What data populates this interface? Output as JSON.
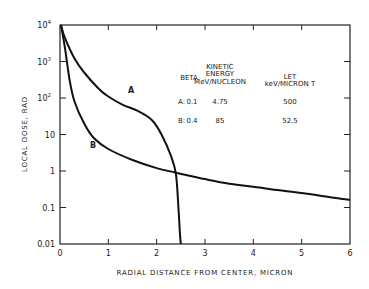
{
  "chart_data": {
    "type": "line",
    "title": "",
    "xlabel": "RADIAL DISTANCE FROM CENTER, MICRON",
    "ylabel": "LOCAL DOSE, RAD",
    "xlim": [
      0,
      6
    ],
    "ylim": [
      0.01,
      10000
    ],
    "yscale": "log",
    "grid": false,
    "x_ticks": [
      "0",
      "1",
      "2",
      "3",
      "4",
      "5",
      "6"
    ],
    "y_ticks": [
      {
        "value": 10000,
        "label": "10",
        "sup": "4"
      },
      {
        "value": 1000,
        "label": "10",
        "sup": "3"
      },
      {
        "value": 100,
        "label": "10",
        "sup": "2"
      },
      {
        "value": 10,
        "label": "10",
        "sup": ""
      },
      {
        "value": 1,
        "label": "1",
        "sup": ""
      },
      {
        "value": 0.1,
        "label": "0.1",
        "sup": ""
      },
      {
        "value": 0.01,
        "label": "0.01",
        "sup": ""
      }
    ],
    "series": [
      {
        "name": "A",
        "x": [
          0.02,
          0.1,
          0.3,
          0.5,
          0.8,
          1.0,
          1.3,
          1.6,
          1.9,
          2.1,
          2.3,
          2.4,
          2.45,
          2.48,
          2.5
        ],
        "values": [
          10000,
          4500,
          1200,
          500,
          180,
          110,
          65,
          45,
          25,
          10,
          2.5,
          0.8,
          0.1,
          0.02,
          0.01
        ]
      },
      {
        "name": "B",
        "x": [
          0.02,
          0.1,
          0.2,
          0.3,
          0.5,
          0.7,
          1.0,
          1.5,
          2.0,
          2.4,
          3.0,
          3.5,
          4.0,
          4.5,
          5.0,
          5.5,
          6.0
        ],
        "values": [
          10000,
          2500,
          300,
          80,
          20,
          8,
          4,
          2,
          1.2,
          0.9,
          0.6,
          0.45,
          0.37,
          0.3,
          0.25,
          0.2,
          0.16
        ]
      }
    ],
    "annotations": [
      {
        "text": "A",
        "x": 1.5,
        "y": 150
      },
      {
        "text": "B",
        "x": 0.6,
        "y": 3.2
      }
    ],
    "legend_table": {
      "headers": [
        "",
        "BETA",
        "KINETIC ENERGY MeV/NUCLEON",
        "LET keV/MICRON T"
      ],
      "rows": [
        {
          "label": "A:",
          "beta": "0.1",
          "energy": "4.75",
          "let": "500"
        },
        {
          "label": "B:",
          "beta": "0.4",
          "energy": "85",
          "let": "52.5"
        }
      ]
    }
  },
  "legend": {
    "header_beta": "BETA",
    "header_energy_1": "KINETIC",
    "header_energy_2": "ENERGY",
    "header_energy_3": "MeV/NUCLEON",
    "header_let_1": "LET",
    "header_let_2": "keV/MICRON T",
    "row_a_label": "A:",
    "row_a_beta": "0.1",
    "row_a_energy": "4.75",
    "row_a_let": "500",
    "row_b_label": "B:",
    "row_b_beta": "0.4",
    "row_b_energy": "85",
    "row_b_let": "52.5"
  },
  "labels": {
    "curve_a": "A",
    "curve_b": "B",
    "xlabel": "RADIAL DISTANCE FROM CENTER, MICRON",
    "ylabel": "LOCAL DOSE, RAD"
  },
  "colors": {
    "line": "#111111",
    "axis": "#222222",
    "background": "#ffffff"
  }
}
